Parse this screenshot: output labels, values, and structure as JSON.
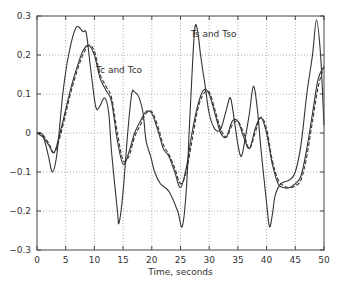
{
  "chart_data": {
    "type": "line",
    "title": "",
    "xlabel": "Time, seconds",
    "ylabel": "",
    "xlim": [
      0,
      50
    ],
    "ylim": [
      -0.3,
      0.3
    ],
    "xticks": [
      0,
      5,
      10,
      15,
      20,
      25,
      30,
      35,
      40,
      45,
      50
    ],
    "yticks": [
      -0.3,
      -0.2,
      -0.1,
      0,
      0.1,
      0.2,
      0.3
    ],
    "ytick_labels": [
      "−0.3",
      "−0.2",
      "−0.1",
      "0",
      "0.1",
      "0.2",
      "0.3"
    ],
    "grid": true,
    "legend": "none",
    "annotations": [
      {
        "text": "Tc and Tco",
        "x": 10.3,
        "y": 0.155
      },
      {
        "text": "Ts and Tso",
        "x": 26.8,
        "y": 0.245
      }
    ],
    "series": [
      {
        "name": "Ts",
        "style": "solid",
        "x": [
          0,
          1,
          2,
          2.7,
          3.5,
          4.5,
          5.5,
          6.8,
          8,
          8.6,
          9.3,
          10.2,
          10.8,
          11.8,
          12.5,
          13,
          14,
          14.3,
          15,
          15.8,
          16.5,
          17,
          17.8,
          18.5,
          19,
          19.8,
          20.5,
          21.5,
          23,
          24.5,
          25.3,
          26,
          26.5,
          27,
          27.5,
          28,
          28.5,
          29.3,
          30,
          31,
          32,
          33,
          33.7,
          34.4,
          35,
          35.6,
          36.2,
          37,
          37.7,
          38.4,
          39,
          40,
          40.5,
          41,
          41.5,
          42.5,
          44,
          45,
          46,
          47,
          48,
          48.7,
          49.4,
          50
        ],
        "y": [
          0,
          -0.005,
          -0.06,
          -0.1,
          -0.05,
          0.1,
          0.2,
          0.27,
          0.26,
          0.255,
          0.17,
          0.07,
          0.065,
          0.09,
          0.05,
          -0.05,
          -0.2,
          -0.23,
          -0.15,
          0,
          0.1,
          0.105,
          0.09,
          0.05,
          -0.02,
          -0.06,
          -0.1,
          -0.13,
          -0.15,
          -0.2,
          -0.24,
          -0.15,
          0,
          0.15,
          0.27,
          0.26,
          0.2,
          0.12,
          0.05,
          0.01,
          0.01,
          0.06,
          0.09,
          0.03,
          -0.03,
          -0.06,
          -0.02,
          0.05,
          0.12,
          0.06,
          -0.04,
          -0.18,
          -0.24,
          -0.21,
          -0.16,
          -0.13,
          -0.12,
          -0.1,
          -0.03,
          0.1,
          0.2,
          0.29,
          0.2,
          0.02
        ]
      },
      {
        "name": "Tc",
        "style": "solid",
        "x": [
          0,
          1,
          2,
          3,
          4,
          5,
          6,
          7,
          8,
          9,
          10,
          11,
          12,
          13,
          14,
          15,
          16,
          17,
          18,
          19,
          20,
          21,
          22,
          23,
          24,
          25,
          26,
          27,
          28,
          29,
          30,
          31,
          32,
          33,
          34,
          35,
          36,
          37,
          38,
          39,
          40,
          41,
          42,
          43,
          44,
          45,
          46,
          47,
          48,
          49,
          50
        ],
        "y": [
          0,
          -0.01,
          -0.03,
          -0.05,
          0.0,
          0.06,
          0.12,
          0.17,
          0.21,
          0.225,
          0.2,
          0.14,
          0.11,
          0.08,
          -0.02,
          -0.08,
          -0.05,
          0.0,
          0.03,
          0.055,
          0.05,
          0.01,
          -0.04,
          -0.06,
          -0.1,
          -0.14,
          -0.09,
          0.0,
          0.07,
          0.11,
          0.1,
          0.05,
          0.0,
          -0.01,
          0.03,
          0.03,
          -0.01,
          -0.04,
          0.01,
          0.04,
          0.0,
          -0.08,
          -0.13,
          -0.14,
          -0.14,
          -0.13,
          -0.11,
          -0.04,
          0.05,
          0.14,
          0.17
        ]
      },
      {
        "name": "Tco",
        "style": "dashed",
        "x": [
          0,
          1,
          2,
          3,
          4,
          5,
          6,
          7,
          8,
          9,
          10,
          11,
          12,
          13,
          14,
          15,
          16,
          17,
          18,
          19,
          20,
          21,
          22,
          23,
          24,
          25,
          26,
          27,
          28,
          29,
          30,
          31,
          32,
          33,
          34,
          35,
          36,
          37,
          38,
          39,
          40,
          41,
          42,
          43,
          44,
          45,
          46,
          47,
          48,
          49,
          50
        ],
        "y": [
          0,
          -0.005,
          -0.025,
          -0.05,
          -0.01,
          0.05,
          0.11,
          0.16,
          0.2,
          0.225,
          0.21,
          0.15,
          0.12,
          0.09,
          0.0,
          -0.07,
          -0.06,
          -0.01,
          0.02,
          0.05,
          0.055,
          0.02,
          -0.03,
          -0.055,
          -0.09,
          -0.13,
          -0.1,
          -0.02,
          0.06,
          0.1,
          0.105,
          0.06,
          0.01,
          -0.01,
          0.02,
          0.03,
          0.0,
          -0.04,
          0.0,
          0.04,
          0.01,
          -0.07,
          -0.12,
          -0.135,
          -0.14,
          -0.135,
          -0.12,
          -0.06,
          0.03,
          0.12,
          0.17
        ]
      }
    ]
  }
}
